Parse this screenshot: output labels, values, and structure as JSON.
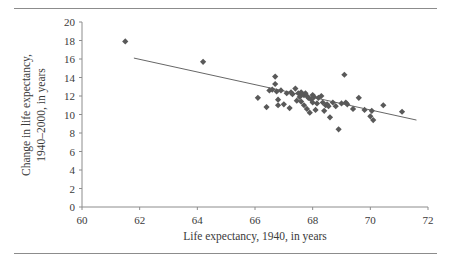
{
  "figure": {
    "background_color": "#ffffff",
    "rule_color": "#8c8c8c",
    "has_top_rule": true,
    "has_bottom_rule": true
  },
  "chart_data": {
    "type": "scatter",
    "title": "",
    "subtitle": "",
    "xlabel": "Life expectancy, 1940, in years",
    "ylabel": "Change in life expectancy,\n1940–2000, in years",
    "ylabel_line1": "Change in life expectancy,",
    "ylabel_line2": "1940–2000, in years",
    "xlim": [
      60,
      72
    ],
    "ylim": [
      0,
      20
    ],
    "xticks": [
      60,
      62,
      64,
      66,
      68,
      70,
      72
    ],
    "xtick_labels": [
      "60",
      "62",
      "64",
      "66",
      "68",
      "70",
      "72"
    ],
    "yticks": [
      0,
      2,
      4,
      6,
      8,
      10,
      12,
      14,
      16,
      18,
      20
    ],
    "ytick_labels": [
      "0",
      "2",
      "4",
      "6",
      "8",
      "10",
      "12",
      "14",
      "16",
      "18",
      "20"
    ],
    "grid": false,
    "legend": false,
    "legend_position": "none",
    "marker": "diamond",
    "marker_color": "#595959",
    "marker_size": 4,
    "line_color": "#555555",
    "trendline": {
      "type": "linear",
      "x_start": 61.8,
      "y_start": 16.1,
      "x_end": 71.6,
      "y_end": 9.4
    },
    "x": [
      61.5,
      64.2,
      66.1,
      66.4,
      66.5,
      66.6,
      66.7,
      66.7,
      66.75,
      66.8,
      66.8,
      66.9,
      67.0,
      67.1,
      67.2,
      67.25,
      67.3,
      67.4,
      67.45,
      67.5,
      67.55,
      67.6,
      67.6,
      67.65,
      67.7,
      67.7,
      67.75,
      67.8,
      67.8,
      67.85,
      67.9,
      67.95,
      68.0,
      68.0,
      68.05,
      68.1,
      68.15,
      68.2,
      68.3,
      68.35,
      68.4,
      68.45,
      68.5,
      68.55,
      68.6,
      68.7,
      68.8,
      68.9,
      69.0,
      69.1,
      69.15,
      69.2,
      69.4,
      69.6,
      69.8,
      70.0,
      70.05,
      70.1,
      70.45,
      71.1
    ],
    "y": [
      17.9,
      15.7,
      11.8,
      10.8,
      12.6,
      12.7,
      13.3,
      14.1,
      12.5,
      11.6,
      11.0,
      12.6,
      11.1,
      12.3,
      10.7,
      12.4,
      12.2,
      12.8,
      11.5,
      12.3,
      11.9,
      12.4,
      11.4,
      12.2,
      12.1,
      11.0,
      12.3,
      12.0,
      10.6,
      11.8,
      10.2,
      11.6,
      12.1,
      11.3,
      11.9,
      10.5,
      11.2,
      11.8,
      12.0,
      11.3,
      10.4,
      11.0,
      11.1,
      10.9,
      9.7,
      11.3,
      10.9,
      8.4,
      11.2,
      14.3,
      11.3,
      11.1,
      10.6,
      11.8,
      10.5,
      9.8,
      10.4,
      9.4,
      11.0,
      10.3
    ],
    "n_points": 60
  }
}
